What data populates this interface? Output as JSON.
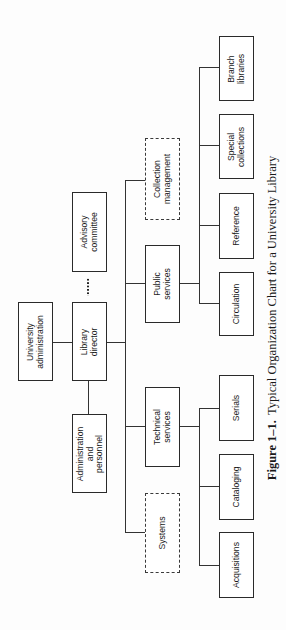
{
  "diagram": {
    "type": "organization-chart",
    "orientation": "rotated-90-ccw",
    "nodes": {
      "university_administration": "University\nadministration",
      "library_director": "Library\ndirector",
      "advisory_committee": "Advisory\ncommittee",
      "administration_personnel": "Administration\nand personnel",
      "collection_management": "Collection\nmanagement",
      "public_services": "Public\nservices",
      "technical_services": "Technical\nservices",
      "systems": "Systems",
      "branch_libraries": "Branch\nlibraries",
      "special_collections": "Special\ncollections",
      "reference": "Reference",
      "circulation": "Circulation",
      "serials": "Serials",
      "cataloging": "Cataloging",
      "acquisitions": "Acquisitions"
    },
    "edges": [
      {
        "from": "university_administration",
        "to": "library_director",
        "style": "solid"
      },
      {
        "from": "library_director",
        "to": "advisory_committee",
        "style": "dotted"
      },
      {
        "from": "library_director",
        "to": "administration_personnel",
        "style": "solid"
      },
      {
        "from": "library_director",
        "to": "collection_management",
        "style": "solid"
      },
      {
        "from": "library_director",
        "to": "public_services",
        "style": "solid"
      },
      {
        "from": "library_director",
        "to": "technical_services",
        "style": "solid"
      },
      {
        "from": "library_director",
        "to": "systems",
        "style": "solid"
      },
      {
        "from": "public_services",
        "to": "circulation",
        "style": "solid"
      },
      {
        "from": "public_services",
        "to": "reference",
        "style": "solid"
      },
      {
        "from": "public_services",
        "to": "special_collections",
        "style": "solid"
      },
      {
        "from": "public_services",
        "to": "branch_libraries",
        "style": "solid"
      },
      {
        "from": "technical_services",
        "to": "serials",
        "style": "solid"
      },
      {
        "from": "technical_services",
        "to": "cataloging",
        "style": "solid"
      },
      {
        "from": "technical_services",
        "to": "acquisitions",
        "style": "solid"
      }
    ],
    "dashed_nodes": [
      "collection_management",
      "systems"
    ]
  },
  "caption": {
    "figure_label": "Figure 1–1.",
    "title": "Typical Organization Chart for a University Library"
  }
}
